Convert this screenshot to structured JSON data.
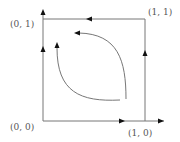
{
  "diagram": {
    "type": "phase-portrait",
    "corners": {
      "origin": "(0, 0)",
      "top_left": "(0, 1)",
      "top_right": "(1, 1)",
      "bottom_right": "(1, 0)"
    },
    "colors": {
      "line": "#777777",
      "arrow": "#111111",
      "label": "#555555",
      "background": "#ffffff"
    },
    "edges": [
      {
        "name": "left-edge",
        "from": "(0, 0)",
        "to": "(0, 1)",
        "direction": "up"
      },
      {
        "name": "top-edge",
        "from": "(1, 1)",
        "to": "(0, 1)",
        "direction": "left"
      },
      {
        "name": "right-edge",
        "from": "(1, 0)",
        "to": "(1, 1)",
        "direction": "up"
      },
      {
        "name": "bottom-edge",
        "from": "(0, 0)",
        "to": "(1, 0)",
        "direction": "right"
      }
    ],
    "interior_curves": [
      {
        "name": "outer-curve",
        "direction": "from lower-right up and to the left"
      },
      {
        "name": "inner-curve",
        "direction": "from bottom going left then up"
      }
    ]
  }
}
